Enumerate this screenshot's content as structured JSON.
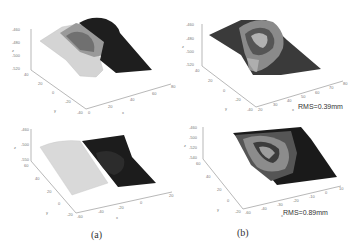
{
  "figure": {
    "captions": {
      "a": "(a)",
      "b": "(b)"
    },
    "panels": [
      {
        "id": "a-top",
        "z_ticks": [
          "-460",
          "-480",
          "-500",
          "-520"
        ],
        "y_ticks": [
          "40",
          "20",
          "0",
          "-20",
          "-40"
        ],
        "x_ticks": [
          "0",
          "20",
          "40",
          "60",
          "80"
        ],
        "axis_labels": {
          "x": "x",
          "y": "y",
          "z": "z"
        }
      },
      {
        "id": "b-top",
        "z_ticks": [
          "-460",
          "-480",
          "-500",
          "-520"
        ],
        "y_ticks": [
          "40",
          "20",
          "0",
          "-20",
          "-40"
        ],
        "x_ticks": [
          "20",
          "30",
          "40",
          "50",
          "60",
          "70",
          "80"
        ],
        "axis_labels": {
          "x": "x",
          "y": "y",
          "z": "z"
        },
        "annotation": "RMS=0.39mm"
      },
      {
        "id": "a-bottom",
        "z_ticks": [
          "-460",
          "-500",
          "-550"
        ],
        "y_ticks": [
          "60",
          "40",
          "20",
          "0",
          "-20"
        ],
        "x_ticks": [
          "-60",
          "-40",
          "-20",
          "0",
          "20"
        ],
        "axis_labels": {
          "x": "x",
          "y": "y",
          "z": "z"
        }
      },
      {
        "id": "b-bottom",
        "z_ticks": [
          "-460",
          "-500",
          "-520",
          "-540"
        ],
        "y_ticks": [
          "60",
          "40",
          "20",
          "0",
          "-20"
        ],
        "x_ticks": [
          "-60",
          "-40",
          "-30",
          "-20",
          "-10",
          "0",
          "10"
        ],
        "axis_labels": {
          "x": "x",
          "y": "y",
          "z": "z"
        },
        "annotation": "RMS=0.89mm"
      }
    ]
  }
}
